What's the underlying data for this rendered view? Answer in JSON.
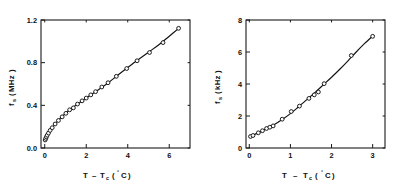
{
  "figure": {
    "name": "two-panel-frequency-vs-temperature-figure",
    "background_color": "#ffffff",
    "axis_color": "#1a1a1a",
    "marker_fill": "#ffffff",
    "marker_stroke": "#111111",
    "curve_color": "#111111"
  },
  "chart_data": [
    {
      "panel": "left",
      "type": "scatter",
      "title": "",
      "xlabel": "T − T_c (°C)",
      "xlabel_parts": {
        "lead": "T",
        "minus": "–",
        "symbol": "T",
        "subscript": "c",
        "open": "(",
        "degree": "°",
        "unit": "C",
        "close": ")"
      },
      "ylabel": "f_s (MHz)",
      "ylabel_parts": {
        "symbol": "f",
        "subscript": "s",
        "open": "(",
        "unit": "MHz",
        "close": ")"
      },
      "xlim": [
        -0.18,
        7.0
      ],
      "ylim": [
        0.0,
        1.2
      ],
      "xticks": [
        0,
        2,
        4,
        6
      ],
      "xticklabels": [
        "0",
        "2",
        "4",
        "6"
      ],
      "yticks": [
        0.0,
        0.4,
        0.8,
        1.2
      ],
      "yticklabels": [
        "0.0",
        "0.4",
        "0.8",
        "1.2"
      ],
      "grid": false,
      "legend": false,
      "marker_style": "open-circle",
      "x": [
        0.02,
        0.05,
        0.08,
        0.12,
        0.18,
        0.26,
        0.36,
        0.5,
        0.66,
        0.84,
        1.02,
        1.2,
        1.38,
        1.58,
        1.8,
        2.0,
        2.22,
        2.45,
        2.75,
        3.05,
        3.45,
        3.95,
        4.45,
        5.05,
        5.7,
        6.45
      ],
      "y": [
        0.075,
        0.09,
        0.105,
        0.12,
        0.14,
        0.165,
        0.19,
        0.225,
        0.258,
        0.292,
        0.325,
        0.358,
        0.376,
        0.412,
        0.442,
        0.468,
        0.498,
        0.528,
        0.572,
        0.612,
        0.672,
        0.745,
        0.818,
        0.895,
        0.988,
        1.122
      ],
      "curve": {
        "description": "smooth concave-down fit through the data",
        "x": [
          0.0,
          0.1,
          0.25,
          0.5,
          0.8,
          1.1,
          1.5,
          2.0,
          2.5,
          3.0,
          3.5,
          4.0,
          4.5,
          5.0,
          5.5,
          6.0,
          6.5
        ],
        "y": [
          0.068,
          0.112,
          0.16,
          0.225,
          0.288,
          0.34,
          0.4,
          0.468,
          0.535,
          0.602,
          0.68,
          0.755,
          0.828,
          0.898,
          0.968,
          1.048,
          1.128
        ]
      }
    },
    {
      "panel": "right",
      "type": "scatter",
      "title": "",
      "xlabel": "T − T_c (°C)",
      "xlabel_parts": {
        "lead": "T",
        "minus": "–",
        "symbol": "T",
        "subscript": "c",
        "open": "(",
        "degree": "°",
        "unit": "C",
        "close": ")"
      },
      "ylabel": "f_s (kHz)",
      "ylabel_parts": {
        "symbol": "f",
        "subscript": "s",
        "open": "(",
        "unit": "kHz",
        "close": ")"
      },
      "xlim": [
        -0.08,
        3.3
      ],
      "ylim": [
        0.0,
        8.0
      ],
      "xticks": [
        0,
        1,
        2,
        3
      ],
      "xticklabels": [
        "0",
        "1",
        "2",
        "3"
      ],
      "yticks": [
        0,
        2,
        4,
        6,
        8
      ],
      "yticklabels": [
        "0",
        "2",
        "4",
        "6",
        "8"
      ],
      "grid": false,
      "legend": false,
      "marker_style": "open-circle",
      "x": [
        0.03,
        0.09,
        0.22,
        0.32,
        0.42,
        0.5,
        0.58,
        0.8,
        1.02,
        1.22,
        1.45,
        1.58,
        1.68,
        1.82,
        2.48,
        3.0
      ],
      "y": [
        0.72,
        0.78,
        0.95,
        1.08,
        1.22,
        1.3,
        1.38,
        1.8,
        2.28,
        2.62,
        3.1,
        3.32,
        3.5,
        4.02,
        5.78,
        6.98
      ],
      "curve": {
        "description": "smooth nearly linear, slightly concave-up fit through the data",
        "x": [
          0.0,
          0.2,
          0.4,
          0.6,
          0.8,
          1.0,
          1.2,
          1.4,
          1.6,
          1.8,
          2.0,
          2.2,
          2.4,
          2.6,
          2.8,
          3.0
        ],
        "y": [
          0.7,
          0.93,
          1.18,
          1.45,
          1.78,
          2.15,
          2.58,
          3.02,
          3.48,
          3.95,
          4.42,
          4.92,
          5.45,
          6.0,
          6.52,
          7.0
        ]
      }
    }
  ]
}
